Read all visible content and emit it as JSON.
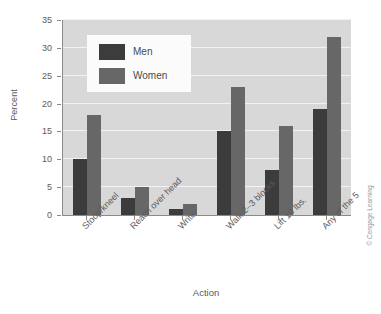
{
  "chart_data": {
    "type": "bar",
    "title": "",
    "xlabel": "Action",
    "ylabel": "Percent",
    "ylim": [
      0,
      35
    ],
    "yticks": [
      0,
      5,
      10,
      15,
      20,
      25,
      30,
      35
    ],
    "grid": true,
    "legend_position": "upper-left-inside",
    "categories": [
      "Stoop/kneel",
      "Reach over head",
      "Write",
      "Walk 2–3 blocks",
      "Lift 10 lbs.",
      "Any of the 5"
    ],
    "series": [
      {
        "name": "Men",
        "color": "#3c3c3c",
        "values": [
          10,
          3,
          1,
          15,
          8,
          19
        ]
      },
      {
        "name": "Women",
        "color": "#676767",
        "values": [
          18,
          5,
          2,
          23,
          16,
          32
        ]
      }
    ]
  },
  "axes": {
    "y_title": "Percent",
    "x_title": "Action",
    "y_tick_labels": [
      "0",
      "5",
      "10",
      "15",
      "20",
      "25",
      "30",
      "35"
    ]
  },
  "legend": {
    "entries": [
      {
        "label": "Men"
      },
      {
        "label": "Women"
      }
    ]
  },
  "credit": {
    "text": "© Cengage Learning"
  },
  "colors": {
    "men": "#3c3c3c",
    "women": "#676767",
    "plot_background": "#d8d8d8",
    "gridline": "#f2f2f2",
    "axis": "#8a8a8a",
    "text": "#5a5a5a"
  }
}
